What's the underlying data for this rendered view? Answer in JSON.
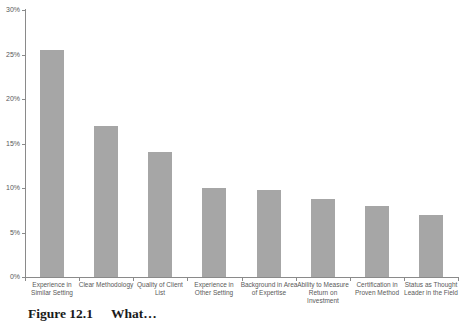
{
  "chart_data": {
    "type": "bar",
    "title": "",
    "xlabel": "",
    "ylabel": "",
    "categories": [
      "Experience in Similar Setting",
      "Clear Methodology",
      "Quality of Client List",
      "Experience in Other Setting",
      "Background in Area of Expertise",
      "Ability to Measure Return on Investment",
      "Certification in Proven Method",
      "Status as Thought Leader in the Field"
    ],
    "category_lines": [
      [
        "Experience in",
        "Similar Setting"
      ],
      [
        "Clear Methodology"
      ],
      [
        "Quality of Client",
        "List"
      ],
      [
        "Experience in",
        "Other Setting"
      ],
      [
        "Background in Area",
        "of Expertise"
      ],
      [
        "Ability to Measure",
        "Return on",
        "Investment"
      ],
      [
        "Certification in",
        "Proven Method"
      ],
      [
        "Status as Thought",
        "Leader in the Field"
      ]
    ],
    "values": [
      25.5,
      17,
      14,
      10,
      9.8,
      8.8,
      8,
      7
    ],
    "ylim": [
      0,
      30
    ],
    "ytick_step": 5,
    "ytick_labels": [
      "0%",
      "5%",
      "10%",
      "15%",
      "20%",
      "25%",
      "30%"
    ],
    "grid": false,
    "legend": false,
    "bar_color": "#a6a6a6",
    "axis_color": "#8a8a8a",
    "tick_label_color": "#595959"
  },
  "caption": {
    "label": "Figure 12.1",
    "title": "What…"
  }
}
